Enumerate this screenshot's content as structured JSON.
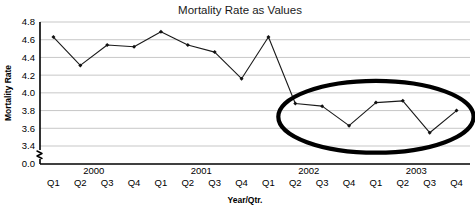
{
  "chart_data": {
    "type": "line",
    "title": "Mortality Rate as Values",
    "xlabel": "Year/Qtr.",
    "ylabel": "Mortality Rate",
    "categories": [
      "Q1",
      "Q2",
      "Q3",
      "Q4",
      "Q1",
      "Q2",
      "Q3",
      "Q4",
      "Q1",
      "Q2",
      "Q3",
      "Q4",
      "Q1",
      "Q2",
      "Q3",
      "Q4"
    ],
    "group_labels": [
      "2000",
      "2001",
      "2002",
      "2003"
    ],
    "values": [
      4.63,
      4.31,
      4.54,
      4.52,
      4.69,
      4.54,
      4.46,
      4.16,
      4.63,
      3.88,
      3.85,
      3.63,
      3.89,
      3.91,
      3.55,
      3.8
    ],
    "ytick_labels": [
      "4.8",
      "4.6",
      "4.4",
      "4.2",
      "4.0",
      "3.8",
      "3.6",
      "3.4",
      "0.0"
    ],
    "ytick_values": [
      4.8,
      4.6,
      4.4,
      4.2,
      4.0,
      3.8,
      3.6,
      3.4,
      0.0
    ],
    "ylim": [
      3.3,
      4.8
    ],
    "axis_break": true,
    "grid": true,
    "legend": "none",
    "annotations": [
      {
        "kind": "ellipse",
        "label": "highlight-ellipse",
        "covers_categories": [
          "Q2 2002",
          "Q3 2002",
          "Q4 2002",
          "Q1 2003",
          "Q2 2003",
          "Q3 2003",
          "Q4 2003"
        ],
        "color": "#000000"
      }
    ],
    "marker_color": "#111111",
    "line_color": "#1a1a1a",
    "grid_color": "#b9b9b9"
  }
}
